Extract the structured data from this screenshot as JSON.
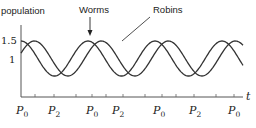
{
  "chart_data": {
    "type": "line",
    "title": "",
    "xlabel": "t",
    "ylabel": "population",
    "y_ticks": [
      {
        "label": "1.5",
        "value": 1.5
      },
      {
        "label": "1",
        "value": 1
      }
    ],
    "x_tick_labels": [
      {
        "label": "P0",
        "sub": "0",
        "base": "P"
      },
      {
        "label": "P2",
        "sub": "2",
        "base": "P"
      },
      {
        "label": "P0",
        "sub": "0",
        "base": "P"
      },
      {
        "label": "P2",
        "sub": "2",
        "base": "P"
      },
      {
        "label": "P0",
        "sub": "0",
        "base": "P"
      },
      {
        "label": "P2",
        "sub": "2",
        "base": "P"
      },
      {
        "label": "P0",
        "sub": "0",
        "base": "P"
      }
    ],
    "grid": false,
    "legend": "annotations",
    "series": [
      {
        "name": "Worms",
        "shape": "sinusoid",
        "max": 1.5,
        "min": 0.55,
        "period_units": 1.0,
        "phase": 0.0
      },
      {
        "name": "Robins",
        "shape": "sinusoid",
        "max": 1.5,
        "min": 0.55,
        "period_units": 1.0,
        "phase": 0.2
      }
    ],
    "annotations": [
      {
        "text": "Worms",
        "points_to": "Worms peak",
        "arrow": true
      },
      {
        "text": "Robins",
        "points_to": "Robins curve",
        "arrow": false
      }
    ]
  },
  "labels": {
    "y_axis": "population",
    "x_axis": "t",
    "worms": "Worms",
    "robins": "Robins",
    "y_1_5": "1.5",
    "y_1": "1"
  }
}
